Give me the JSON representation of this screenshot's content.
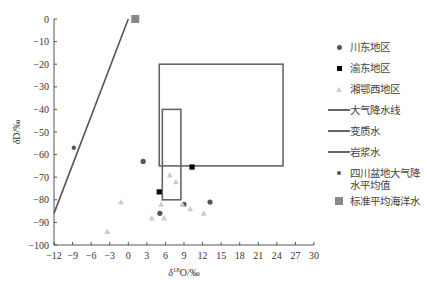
{
  "chart_data": {
    "type": "scatter",
    "title": "",
    "xlabel": "δ18O/‰",
    "ylabel": "δD/‰",
    "xlim": [
      -12,
      30
    ],
    "ylim": [
      -100,
      0
    ],
    "xticks": [
      -12,
      -9,
      -6,
      -3,
      0,
      3,
      6,
      9,
      12,
      15,
      18,
      21,
      24,
      27,
      30
    ],
    "yticks": [
      0,
      -10,
      -20,
      -30,
      -40,
      -50,
      -60,
      -70,
      -80,
      -90,
      -100
    ],
    "grid": false,
    "legend_position": "right",
    "series": [
      {
        "name": "川东地区",
        "marker": "circle",
        "color": "#555555",
        "points": [
          [
            2.4,
            -63
          ],
          [
            5.1,
            -86
          ],
          [
            9.0,
            -82
          ],
          [
            13.2,
            -81
          ]
        ]
      },
      {
        "name": "渝东地区",
        "marker": "square",
        "color": "#000000",
        "points": [
          [
            10.3,
            -65.5
          ],
          [
            5.0,
            -76.5
          ]
        ]
      },
      {
        "name": "湘鄂西地区",
        "marker": "triangle",
        "color": "#cccccc",
        "points": [
          [
            6.7,
            -69
          ],
          [
            7.7,
            -72
          ],
          [
            5.3,
            -82
          ],
          [
            8.7,
            -82
          ],
          [
            10.0,
            -84
          ],
          [
            12.2,
            -86
          ],
          [
            3.8,
            -88
          ],
          [
            5.8,
            -88
          ],
          [
            -1.2,
            -81
          ],
          [
            -3.4,
            -94
          ]
        ]
      },
      {
        "name": "大气降水线",
        "type": "line",
        "color": "#555555",
        "points": [
          [
            -12,
            -86
          ],
          [
            0,
            0
          ]
        ]
      },
      {
        "name": "变质水",
        "type": "box",
        "color": "#666666",
        "x": [
          5,
          25
        ],
        "y": [
          -65,
          -20
        ]
      },
      {
        "name": "岩浆水",
        "type": "box",
        "color": "#666666",
        "x": [
          5.5,
          8.5
        ],
        "y": [
          -80,
          -40
        ]
      },
      {
        "name": "四川盆地大气降水平均值",
        "marker": "small-circle",
        "color": "#555555",
        "points": [
          [
            -8.8,
            -57
          ]
        ]
      },
      {
        "name": "标准平均海洋水",
        "marker": "big-square",
        "color": "#888888",
        "points": [
          [
            0,
            0
          ]
        ]
      }
    ]
  },
  "legend": {
    "items": [
      {
        "label": "川东地区",
        "symbol": "circle"
      },
      {
        "label": "渝东地区",
        "symbol": "square"
      },
      {
        "label": "湘鄂西地区",
        "symbol": "triangle"
      },
      {
        "label": "大气降水线",
        "symbol": "line"
      },
      {
        "label": "变质水",
        "symbol": "line"
      },
      {
        "label": "岩浆水",
        "symbol": "line"
      },
      {
        "label": "四川盆地大气降水平均值",
        "symbol": "small-circle"
      },
      {
        "label": "标准平均海洋水",
        "symbol": "big-square"
      }
    ]
  },
  "axes": {
    "xlabel": "δ18O/‰",
    "ylabel": "δD/‰"
  }
}
